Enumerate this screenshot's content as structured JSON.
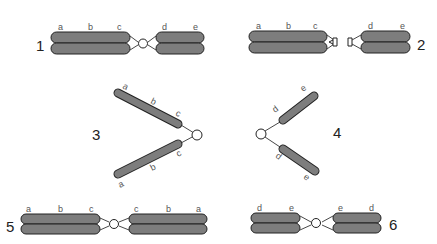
{
  "diagram": {
    "colors": {
      "chromatid": "#7d7d7d",
      "outline": "#222222",
      "centromere": "#ffffff"
    },
    "figures": [
      {
        "number": "1",
        "description": "Normal chromosome with sister chromatids, centromere between arms",
        "left_arm_labels": [
          "a",
          "b",
          "c"
        ],
        "right_arm_labels": [
          "d",
          "e"
        ]
      },
      {
        "number": "2",
        "description": "Centromere misdivision / break at centromere",
        "left_arm_labels": [
          "a",
          "b",
          "c"
        ],
        "right_arm_labels": [
          "d",
          "e"
        ]
      },
      {
        "number": "3",
        "description": "Telocentric left arm, two chromatids",
        "upper_labels": [
          "a",
          "b",
          "c"
        ],
        "lower_labels": [
          "c",
          "b",
          "a"
        ]
      },
      {
        "number": "4",
        "description": "Telocentric right arm, two chromatids",
        "upper_labels": [
          "d",
          "e"
        ],
        "lower_labels": [
          "d",
          "e"
        ]
      },
      {
        "number": "5",
        "description": "Isochromosome of left arm",
        "left_arm_labels": [
          "a",
          "b",
          "c"
        ],
        "right_arm_labels": [
          "c",
          "b",
          "a"
        ]
      },
      {
        "number": "6",
        "description": "Isochromosome of right arm",
        "left_arm_labels": [
          "d",
          "e"
        ],
        "right_arm_labels": [
          "e",
          "d"
        ]
      }
    ],
    "caption_fragment": "... n... ... . f ... ..."
  }
}
